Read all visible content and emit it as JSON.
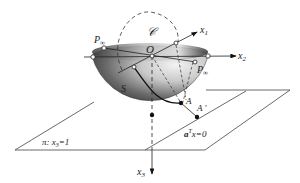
{
  "diagram": {
    "type": "geometric-3d-projection",
    "labels": {
      "circle": "𝒞",
      "origin": "O",
      "x1": "x",
      "x1_sub": "1",
      "x2": "x",
      "x2_sub": "2",
      "x3": "x",
      "x3_sub": "3",
      "p_inf_left": "P",
      "p_inf_left_sub": "∞",
      "p_inf_right": "P",
      "p_inf_right_sub": "∞",
      "surface": "S",
      "point_a": "A",
      "point_a_prime": "A '",
      "plane_pi": "π: x",
      "plane_pi_sub": "3",
      "plane_pi_eq": "=1",
      "hyperplane": "a",
      "hyperplane_sup": "T",
      "hyperplane_eq": "x=0"
    },
    "colors": {
      "line": "#222222",
      "hemisphere_dark": "#3a3a3a",
      "hemisphere_light": "#e6e6e6",
      "background": "#ffffff"
    }
  }
}
